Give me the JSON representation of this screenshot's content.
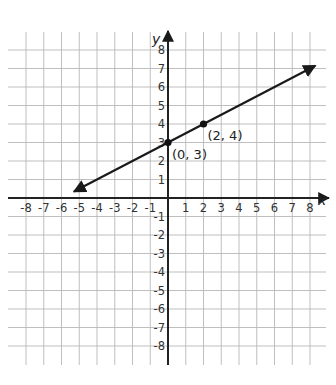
{
  "chart_data": {
    "type": "line",
    "title": "",
    "xlabel": "x",
    "ylabel": "y",
    "xlim": [
      -8,
      8
    ],
    "ylim": [
      -8,
      8
    ],
    "grid": true,
    "x_ticks": [
      -8,
      -7,
      -6,
      -5,
      -4,
      -3,
      -2,
      -1,
      1,
      2,
      3,
      4,
      5,
      6,
      7,
      8
    ],
    "y_ticks": [
      8,
      7,
      6,
      5,
      4,
      3,
      2,
      1,
      -1,
      -2,
      -3,
      -4,
      -5,
      -6,
      -7,
      -8
    ],
    "series": [
      {
        "name": "line",
        "kind": "line with arrows at both ends",
        "slope": 0.5,
        "intercept": 3,
        "x": [
          -5.3,
          8.3
        ],
        "y": [
          0.35,
          7.15
        ]
      }
    ],
    "points": [
      {
        "x": 0,
        "y": 3,
        "label": "(0, 3)"
      },
      {
        "x": 2,
        "y": 4,
        "label": "(2, 4)"
      }
    ]
  },
  "colors": {
    "grid": "#b8b8b8",
    "axis": "#222222",
    "line": "#1a1a1a"
  }
}
